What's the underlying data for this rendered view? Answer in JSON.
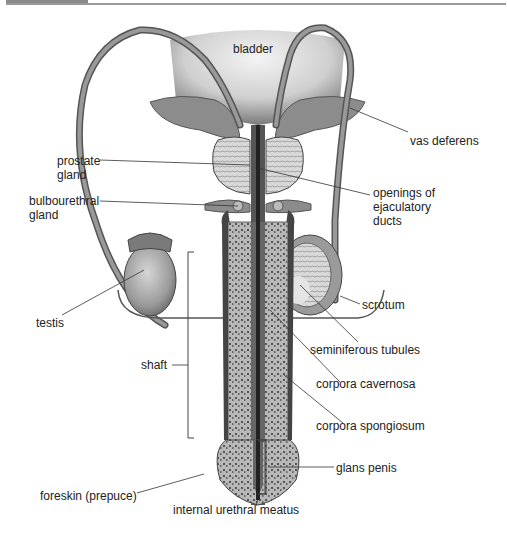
{
  "figure": {
    "colors": {
      "tissue_dark": "#6e6e6e",
      "tissue_mid": "#9c9c9c",
      "tissue_light": "#c9c9c9",
      "line": "#333333",
      "text": "#222222"
    }
  },
  "labels": {
    "bladder": "bladder",
    "vas_deferens": "vas deferens",
    "prostate_gland_1": "prostate",
    "prostate_gland_2": "gland",
    "openings_1": "openings of",
    "openings_2": "ejaculatory",
    "openings_3": "ducts",
    "bulbourethral_1": "bulbourethral",
    "bulbourethral_2": "gland",
    "testis": "testis",
    "scrotum": "scrotum",
    "seminiferous_tubules": "seminiferous tubules",
    "shaft": "shaft",
    "corpora_cavernosa": "corpora cavernosa",
    "corpora_spongiosum": "corpora spongiosum",
    "glans_penis": "glans penis",
    "foreskin": "foreskin (prepuce)",
    "internal_urethral_meatus": "internal urethral meatus"
  }
}
